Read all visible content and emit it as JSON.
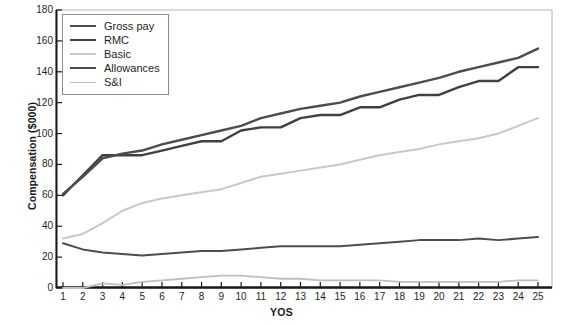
{
  "chart_data": {
    "type": "line",
    "title": "",
    "xlabel": "YOS",
    "ylabel": "Compensation ($000)",
    "xlim": [
      1,
      25
    ],
    "ylim": [
      0,
      180
    ],
    "y_ticks": [
      0,
      20,
      40,
      60,
      80,
      100,
      120,
      140,
      160,
      180
    ],
    "x_ticks": [
      1,
      2,
      3,
      4,
      5,
      6,
      7,
      8,
      9,
      10,
      11,
      12,
      13,
      14,
      15,
      16,
      17,
      18,
      19,
      20,
      21,
      22,
      23,
      24,
      25
    ],
    "grid": false,
    "legend_position": "top-left",
    "x": [
      1,
      2,
      3,
      4,
      5,
      6,
      7,
      8,
      9,
      10,
      11,
      12,
      13,
      14,
      15,
      16,
      17,
      18,
      19,
      20,
      21,
      22,
      23,
      24,
      25
    ],
    "series": [
      {
        "name": "Gross pay",
        "color": "#4d4d4d",
        "width": 2.4,
        "values": [
          61,
          72,
          84,
          87,
          89,
          93,
          96,
          99,
          102,
          105,
          110,
          113,
          116,
          118,
          120,
          124,
          127,
          130,
          133,
          136,
          140,
          143,
          146,
          149,
          155
        ]
      },
      {
        "name": "RMC",
        "color": "#404040",
        "width": 2.4,
        "values": [
          60,
          73,
          86,
          86,
          86,
          89,
          92,
          95,
          95,
          102,
          104,
          104,
          110,
          112,
          112,
          117,
          117,
          122,
          125,
          125,
          130,
          134,
          134,
          143,
          143
        ]
      },
      {
        "name": "Basic",
        "color": "#c8c8c8",
        "width": 2.0,
        "values": [
          32,
          35,
          42,
          50,
          55,
          58,
          60,
          62,
          64,
          68,
          72,
          74,
          76,
          78,
          80,
          83,
          86,
          88,
          90,
          93,
          95,
          97,
          100,
          105,
          110
        ]
      },
      {
        "name": "Allowances",
        "color": "#4d4d4d",
        "width": 2.0,
        "values": [
          29,
          25,
          23,
          22,
          21,
          22,
          23,
          24,
          24,
          25,
          26,
          27,
          27,
          27,
          27,
          28,
          29,
          30,
          31,
          31,
          31,
          32,
          31,
          32,
          33
        ]
      },
      {
        "name": "S&I",
        "color": "#bfbfbf",
        "width": 1.8,
        "values": [
          0,
          0,
          3,
          2,
          4,
          5,
          6,
          7,
          8,
          8,
          7,
          6,
          6,
          5,
          5,
          5,
          5,
          4,
          4,
          4,
          4,
          4,
          4,
          5,
          5
        ]
      }
    ]
  },
  "legend": {
    "items": [
      {
        "label": "Gross pay",
        "color": "#4d4d4d"
      },
      {
        "label": "RMC",
        "color": "#404040"
      },
      {
        "label": "Basic",
        "color": "#c8c8c8"
      },
      {
        "label": "Allowances",
        "color": "#4d4d4d"
      },
      {
        "label": "S&I",
        "color": "#bfbfbf"
      }
    ]
  },
  "axes": {
    "y_title": "Compensation ($000)",
    "x_title": "YOS"
  }
}
